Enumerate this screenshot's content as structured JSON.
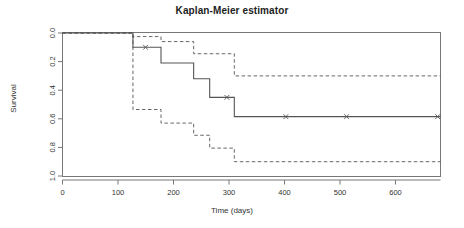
{
  "chart_data": {
    "type": "line",
    "title": "Kaplan-Meier estimator",
    "xlabel": "Time (days)",
    "ylabel": "Survival",
    "xlim": [
      0,
      660
    ],
    "ylim": [
      0.0,
      1.0
    ],
    "grid": false,
    "legend": "none",
    "x_ticks": [
      0,
      100,
      200,
      300,
      400,
      500,
      600
    ],
    "x_tick_labels": [
      "0",
      "100",
      "200",
      "300",
      "400",
      "500",
      "600"
    ],
    "y_ticks": [
      0.0,
      0.2,
      0.4,
      0.6,
      0.8,
      1.0
    ],
    "y_tick_labels": [
      "0.0",
      "0.2",
      "0.4",
      "0.6",
      "0.8",
      "1.0"
    ],
    "series": [
      {
        "name": "survival estimate",
        "style": "solid",
        "color": "#555555",
        "step": "post",
        "x": [
          0,
          123,
          123,
          172,
          172,
          229,
          229,
          257,
          257,
          300,
          300,
          660
        ],
        "y": [
          1.0,
          1.0,
          0.9,
          0.9,
          0.79,
          0.79,
          0.68,
          0.68,
          0.55,
          0.55,
          0.415,
          0.415
        ]
      },
      {
        "name": "upper 95% confidence limit",
        "style": "dashed",
        "color": "#555555",
        "step": "post",
        "x": [
          0,
          123,
          123,
          172,
          172,
          229,
          229,
          300,
          300,
          660
        ],
        "y": [
          1.0,
          1.0,
          0.975,
          0.975,
          0.94,
          0.94,
          0.855,
          0.855,
          0.7,
          0.7
        ]
      },
      {
        "name": "lower 95% confidence limit",
        "style": "dashed",
        "color": "#555555",
        "step": "post",
        "x": [
          0,
          123,
          123,
          172,
          172,
          229,
          229,
          257,
          257,
          300,
          300,
          660
        ],
        "y": [
          1.0,
          1.0,
          0.465,
          0.465,
          0.37,
          0.37,
          0.285,
          0.285,
          0.195,
          0.195,
          0.1,
          0.1
        ]
      }
    ],
    "censor_marks": {
      "symbol": "x",
      "points": [
        {
          "x": 145,
          "y": 0.9
        },
        {
          "x": 287,
          "y": 0.55
        },
        {
          "x": 390,
          "y": 0.415
        },
        {
          "x": 496,
          "y": 0.415
        },
        {
          "x": 655,
          "y": 0.415
        }
      ]
    }
  },
  "axes": {
    "frame_color": "#777777",
    "tick_color": "#777777"
  }
}
